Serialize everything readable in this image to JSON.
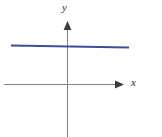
{
  "figure": {
    "width": 162,
    "height": 137,
    "background": "#ffffff"
  },
  "axes": {
    "x_axis": {
      "label": "x",
      "color": "#808080",
      "stroke_width": 1,
      "start_x": 4,
      "end_x": 124,
      "y": 84,
      "arrow": "right-arrowhead"
    },
    "y_axis": {
      "label": "y",
      "color": "#808080",
      "stroke_width": 1,
      "x": 67,
      "start_y": 137,
      "end_y": 22,
      "arrow": "up-arrowhead"
    },
    "origin": {
      "x": 67,
      "y": 84
    },
    "grid": false,
    "tick_labels": []
  },
  "curve": {
    "name": "constant-function-line",
    "color": "#3a4fa3",
    "stroke_width": 2,
    "x_start": 11,
    "x_end": 129,
    "y_start": 45,
    "y_end": 47
  },
  "chart_data": {
    "type": "line",
    "title": "",
    "subtitle": "",
    "xlabel": "x",
    "ylabel": "y",
    "grid": false,
    "legend": [],
    "annotations": [],
    "xlim": [
      -2.8,
      2.6
    ],
    "ylim": [
      -2.4,
      2.8
    ],
    "xticks": [],
    "yticks": [],
    "series": [
      {
        "name": "y = c",
        "color": "#3a4fa3",
        "x": [
          -2.55,
          2.6
        ],
        "y": [
          1.72,
          1.64
        ]
      }
    ]
  }
}
